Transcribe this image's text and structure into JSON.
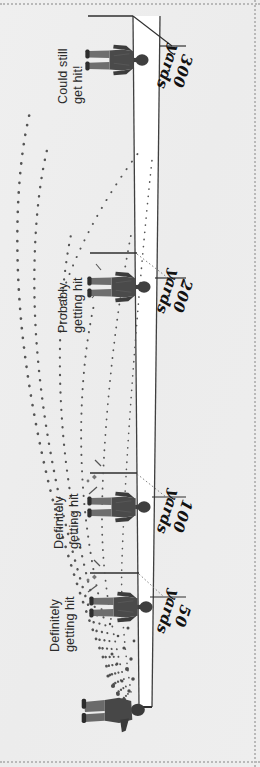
{
  "diagram": {
    "orientation": "rotated-90",
    "background_color": "#eeeeee",
    "cone_fill": "#ffffff",
    "line_color": "#3a3a3a",
    "pellet_color": "#555555",
    "distance_markers": [
      {
        "id": "m300",
        "num": "300",
        "unit": "yards",
        "x": 196,
        "y": 52
      },
      {
        "id": "m200",
        "num": "200",
        "unit": "yards",
        "x": 196,
        "y": 277
      },
      {
        "id": "m100",
        "num": "100",
        "unit": "yards",
        "x": 196,
        "y": 497
      },
      {
        "id": "m50",
        "num": "50",
        "unit": "yards",
        "x": 196,
        "y": 597
      }
    ],
    "annotations": [
      {
        "id": "a300",
        "line1": "Could still",
        "line2": "get hit!",
        "x": 56,
        "y": 104
      },
      {
        "id": "a200",
        "line1": "Probably",
        "line2": "getting hit",
        "x": 56,
        "y": 333
      },
      {
        "id": "a100",
        "line1": "Definitely",
        "line2": "getting hit",
        "x": 52,
        "y": 549
      },
      {
        "id": "a50",
        "line1": "Definitely",
        "line2": "getting hit",
        "x": 48,
        "y": 652
      }
    ],
    "figures": [
      {
        "id": "target-300",
        "role": "target",
        "x": 104,
        "y": 30
      },
      {
        "id": "target-200",
        "role": "target",
        "x": 104,
        "y": 258
      },
      {
        "id": "target-100",
        "role": "target",
        "x": 104,
        "y": 478
      },
      {
        "id": "target-50",
        "role": "target",
        "x": 104,
        "y": 578
      },
      {
        "id": "shooter",
        "role": "shooter",
        "x": 100,
        "y": 678
      }
    ]
  }
}
